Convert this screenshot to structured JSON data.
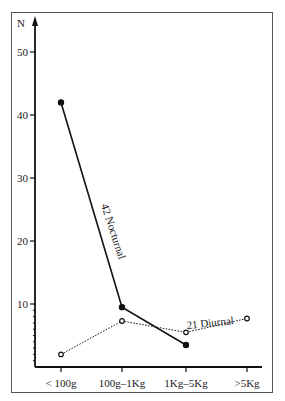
{
  "chart_data": {
    "type": "line",
    "title": "",
    "xlabel": "",
    "ylabel": "N",
    "ylim": [
      0,
      55
    ],
    "yticks": [
      10,
      20,
      30,
      40,
      50
    ],
    "ytick_labels": [
      "10",
      "20",
      "30",
      "40",
      "50"
    ],
    "categories": [
      "< 100g",
      "100g–1Kg",
      "1Kg–5Kg",
      ">5Kg"
    ],
    "grid": false,
    "legend": "inline labels",
    "series": [
      {
        "name": "Nocturnal",
        "total": 42,
        "label": "42  Nocturnal",
        "style": "solid, filled dots",
        "values": [
          42,
          9.5,
          3.5,
          null
        ]
      },
      {
        "name": "Diurnal",
        "total": 21,
        "label": "21  Diurnal",
        "style": "dotted, open circles",
        "values": [
          2,
          7.3,
          5.5,
          7.7
        ]
      }
    ]
  }
}
